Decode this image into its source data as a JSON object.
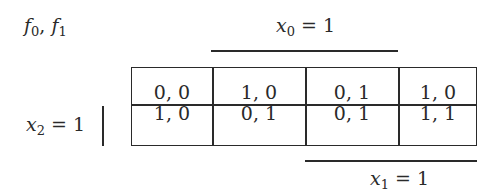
{
  "title": {
    "f0": "f",
    "f0_sub": "0",
    "sep": ", ",
    "f1": "f",
    "f1_sub": "1"
  },
  "labels": {
    "x0": {
      "var": "x",
      "sub": "0",
      "eq": " = 1"
    },
    "x1": {
      "var": "x",
      "sub": "1",
      "eq": " = 1"
    },
    "x2": {
      "var": "x",
      "sub": "2",
      "eq": " = 1"
    }
  },
  "table": {
    "rows": [
      [
        "0, 0",
        "1, 0",
        "0, 1",
        "1, 0"
      ],
      [
        "1, 0",
        "0, 1",
        "0, 1",
        "1, 1"
      ]
    ]
  },
  "colors": {
    "ink": "#2a2a2a",
    "background": "#ffffff"
  }
}
